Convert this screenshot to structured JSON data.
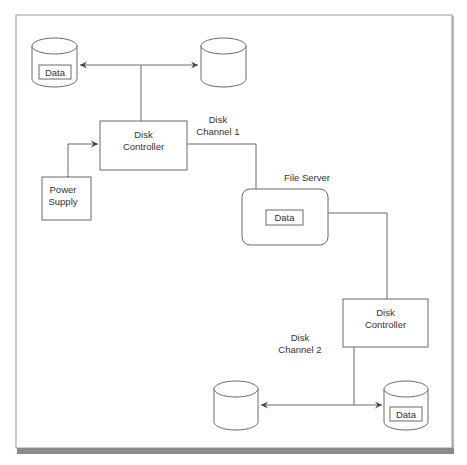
{
  "diagram": {
    "type": "storage-redundancy-diagram",
    "nodes": {
      "disk_top_left": {
        "kind": "disk",
        "label": "Data"
      },
      "disk_top_right": {
        "kind": "disk",
        "label": ""
      },
      "controller_1": {
        "kind": "controller",
        "line1": "Disk",
        "line2": "Controller"
      },
      "power_supply": {
        "kind": "power-supply",
        "line1": "Power",
        "line2": "Supply"
      },
      "file_server": {
        "kind": "server",
        "title": "File Server",
        "inner_label": "Data"
      },
      "controller_2": {
        "kind": "controller",
        "line1": "Disk",
        "line2": "Controller"
      },
      "disk_bottom_left": {
        "kind": "disk",
        "label": ""
      },
      "disk_bottom_right": {
        "kind": "disk",
        "label": "Data"
      }
    },
    "labels": {
      "channel_1": {
        "line1": "Disk",
        "line2": "Channel 1"
      },
      "channel_2": {
        "line1": "Disk",
        "line2": "Channel 2"
      }
    },
    "edges": [
      {
        "from": "controller_1",
        "to": "disk_top_left",
        "arrow": "to"
      },
      {
        "from": "controller_1",
        "to": "disk_top_right",
        "arrow": "to"
      },
      {
        "from": "controller_1",
        "to": "power_supply",
        "arrow": "both"
      },
      {
        "from": "controller_1",
        "to": "file_server",
        "arrow": "none",
        "label": "Disk Channel 1"
      },
      {
        "from": "file_server",
        "to": "controller_2",
        "arrow": "none"
      },
      {
        "from": "controller_2",
        "to": "disk_bottom_left",
        "arrow": "to",
        "label": "Disk Channel 2"
      },
      {
        "from": "controller_2",
        "to": "disk_bottom_right",
        "arrow": "to"
      }
    ]
  },
  "colors": {
    "line": "#6a6a6a",
    "text": "#333333",
    "frame_shadow": "#8a8a8a"
  }
}
